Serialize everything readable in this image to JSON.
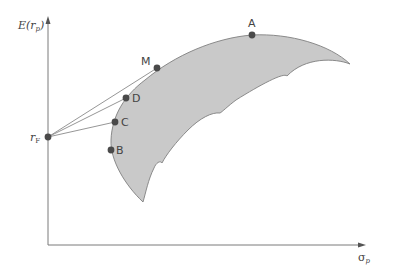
{
  "diagram": {
    "type": "efficient-frontier",
    "axes": {
      "y_label_main": "E(r",
      "y_label_sub": "p",
      "y_label_close": ")",
      "x_label_main": "σ",
      "x_label_sub": "p"
    },
    "risk_free": {
      "label_main": "r",
      "label_sub": "F"
    },
    "points": [
      {
        "id": "A",
        "label": "A"
      },
      {
        "id": "M",
        "label": "M"
      },
      {
        "id": "D",
        "label": "D"
      },
      {
        "id": "C",
        "label": "C"
      },
      {
        "id": "B",
        "label": "B"
      }
    ],
    "colors": {
      "region_fill": "#c9c9c9",
      "region_stroke": "#808080",
      "axis": "#7a7a7a",
      "line": "#8a8a8a",
      "point": "#4a4a4a",
      "text": "#444444"
    }
  }
}
